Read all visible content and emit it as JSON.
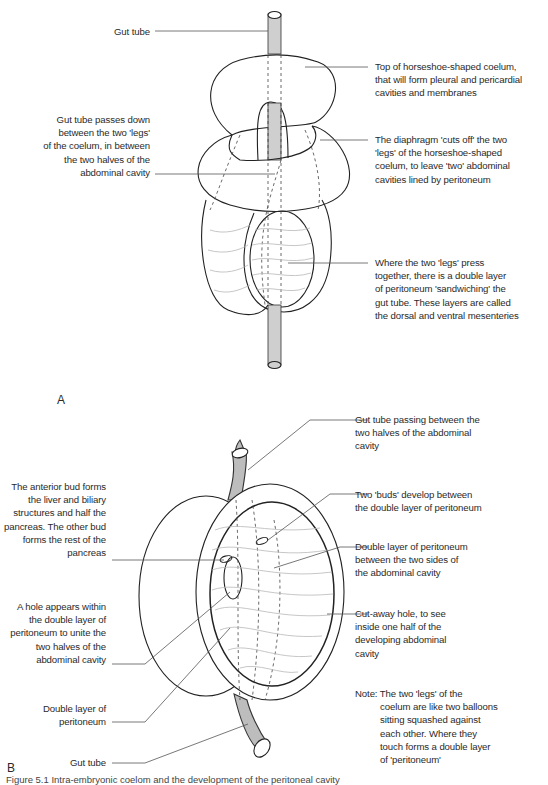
{
  "figure": {
    "panels": [
      {
        "id": "A",
        "label": "A",
        "annotations": {
          "gut_tube": "Gut tube",
          "top_coelum": [
            "Top of horseshoe-shaped coelum,",
            "that will form pleural and pericardial",
            "cavities and membranes"
          ],
          "gut_passes": [
            "Gut tube passes down",
            "between the two 'legs'",
            "of the coelum, in between",
            "the two halves of the",
            "abdominal cavity"
          ],
          "diaphragm": [
            "The diaphragm 'cuts off' the two",
            "'legs' of the horseshoe-shaped",
            "coelum, to leave 'two' abdominal",
            "cavities lined by peritoneum"
          ],
          "legs_press": [
            "Where the two 'legs' press",
            "together, there is a double layer",
            "of peritoneum 'sandwiching' the",
            "gut tube. These layers are called",
            "the dorsal and ventral mesenteries"
          ]
        }
      },
      {
        "id": "B",
        "label": "B",
        "annotations": {
          "gut_passing": [
            "Gut tube passing between the",
            "two halves of the abdominal",
            "cavity"
          ],
          "anterior_bud": [
            "The anterior bud forms",
            "the liver and biliary",
            "structures and half the",
            "pancreas. The other bud",
            "forms the rest of the",
            "pancreas"
          ],
          "two_buds": [
            "Two 'buds' develop between",
            "the double layer of peritoneum"
          ],
          "double_layer_sides": [
            "Double layer of peritoneum",
            "between the two sides of",
            "the abdominal cavity"
          ],
          "hole_appears": [
            "A hole appears within",
            "the double layer of",
            "peritoneum to unite the",
            "two halves of the",
            "abdominal cavity"
          ],
          "cutaway": [
            "Cut-away hole, to see",
            "inside one half of the",
            "developing abdominal",
            "cavity"
          ],
          "double_layer": [
            "Double layer of",
            "peritoneum"
          ],
          "gut_tube": "Gut tube",
          "note_prefix": "Note:",
          "note": [
            "The two 'legs' of the",
            "coelum are like two balloons",
            "sitting squashed against",
            "each other. Where they",
            "touch forms a double layer",
            "of 'peritoneum'"
          ]
        }
      }
    ],
    "caption": "Figure 5.1  Intra-embryonic coelom and the development of the peritoneal cavity",
    "colors": {
      "line": "#222222",
      "leader": "#555555",
      "gut_fill": "#c8c8c8",
      "contour": "#b0b0b0"
    }
  }
}
